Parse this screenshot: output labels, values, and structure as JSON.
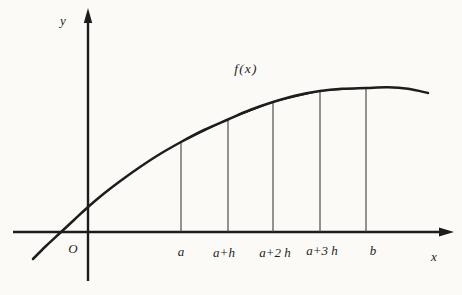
{
  "page": {
    "background_color": "#fbfaf7",
    "ink_color": "#1d1d1d",
    "thin_line_color": "#3c3c3c"
  },
  "figure": {
    "labels": [
      {
        "name": "y-axis-label",
        "text": "y",
        "x": 63,
        "y": 20
      },
      {
        "name": "origin-label",
        "text": "O",
        "x": 73,
        "y": 248
      },
      {
        "name": "function-label",
        "text": "f(x)",
        "x": 246,
        "y": 69
      },
      {
        "name": "ordinate-label-a",
        "text": "a",
        "x": 181,
        "y": 251
      },
      {
        "name": "ordinate-label-a-plus-h",
        "text": "a+h",
        "x": 224,
        "y": 252
      },
      {
        "name": "ordinate-label-a-plus-2h",
        "text": "a+2 h",
        "x": 275,
        "y": 252
      },
      {
        "name": "ordinate-label-a-plus-3h",
        "text": "a+3 h",
        "x": 322,
        "y": 250
      },
      {
        "name": "ordinate-label-b",
        "text": "b",
        "x": 373,
        "y": 250
      },
      {
        "name": "x-axis-label",
        "text": "x",
        "x": 434,
        "y": 256
      }
    ]
  },
  "geometry": {
    "canvas": {
      "width": 462,
      "height": 295
    },
    "x_axis": {
      "x1": 13,
      "x2": 442,
      "y": 232,
      "arrowhead": "454,232 439,227.6 439,236.4"
    },
    "y_axis": {
      "x": 88,
      "y1": 281,
      "y2": 20,
      "arrowhead": "88,8 83.8,23 92.2,23"
    },
    "ordinates": [
      {
        "name": "a",
        "x": 181,
        "y_top": 142
      },
      {
        "name": "a-plus-h",
        "x": 228,
        "y_top": 119.5
      },
      {
        "name": "a-plus-2h",
        "x": 273,
        "y_top": 102
      },
      {
        "name": "a-plus-3h",
        "x": 320,
        "y_top": 91
      },
      {
        "name": "b",
        "x": 366,
        "y_top": 88
      }
    ],
    "curve_points": [
      [
        33,
        259
      ],
      [
        46,
        246
      ],
      [
        60,
        233
      ],
      [
        74,
        220
      ],
      [
        88,
        207
      ],
      [
        104,
        193.5
      ],
      [
        121,
        180.5
      ],
      [
        140,
        167
      ],
      [
        160,
        154
      ],
      [
        181,
        142
      ],
      [
        204,
        130
      ],
      [
        228,
        119.5
      ],
      [
        250,
        110
      ],
      [
        273,
        102
      ],
      [
        296,
        95.5
      ],
      [
        320,
        91
      ],
      [
        342,
        88.8
      ],
      [
        366,
        88
      ],
      [
        388,
        87.3
      ],
      [
        408,
        88.8
      ],
      [
        428,
        93
      ]
    ]
  }
}
